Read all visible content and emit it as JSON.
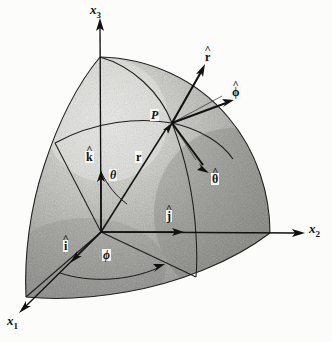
{
  "figure": {
    "background_color": "#fcfcfa",
    "ink_color": "#111111",
    "surface_fill_color": "#9a9a96",
    "surface_light_color": "#d8d8d4"
  },
  "axes": [
    {
      "id": "x3",
      "base": "x",
      "sub": "3",
      "label": "x3",
      "tip": [
        100,
        19
      ],
      "origin": [
        101,
        232
      ]
    },
    {
      "id": "x2",
      "base": "x",
      "sub": "2",
      "label": "x2",
      "tip": [
        305,
        233
      ],
      "origin": [
        101,
        232
      ]
    },
    {
      "id": "x1",
      "base": "x",
      "sub": "1",
      "label": "x1",
      "tip": [
        20,
        312
      ],
      "origin": [
        101,
        232
      ]
    }
  ],
  "point": {
    "label": "P",
    "position": [
      172,
      123
    ]
  },
  "vectors": [
    {
      "id": "r-hat",
      "label": "r",
      "hat": true,
      "bold": true,
      "tip": [
        205,
        66
      ],
      "from": [
        172,
        123
      ]
    },
    {
      "id": "phi-hat",
      "label": "ϕ",
      "hat": true,
      "bold": true,
      "tip": [
        231,
        100
      ],
      "from": [
        172,
        123
      ]
    },
    {
      "id": "theta-hat",
      "label": "θ",
      "hat": true,
      "bold": true,
      "tip": [
        209,
        172
      ],
      "from": [
        172,
        123
      ]
    },
    {
      "id": "k-hat",
      "label": "k",
      "hat": true,
      "bold": true,
      "tip": [
        101,
        173
      ],
      "from": [
        101,
        232
      ]
    },
    {
      "id": "j-hat",
      "label": "j",
      "hat": true,
      "bold": true,
      "tip": [
        182,
        232
      ],
      "from": [
        101,
        232
      ]
    },
    {
      "id": "i-hat",
      "label": "i",
      "hat": true,
      "bold": true,
      "tip": [
        72,
        262
      ],
      "from": [
        101,
        232
      ]
    },
    {
      "id": "r-vector",
      "label": "r",
      "hat": false,
      "bold": true,
      "tip": [
        172,
        123
      ],
      "from": [
        101,
        232
      ]
    }
  ],
  "angles": [
    {
      "id": "theta",
      "label": "θ",
      "position": [
        113,
        176
      ],
      "description": "polar angle from x3 axis to r"
    },
    {
      "id": "phi",
      "label": "ϕ",
      "position": [
        107,
        256
      ],
      "description": "azimuthal angle from x1 axis to projection of r"
    }
  ],
  "labels": {
    "x3": {
      "text": "x",
      "sub": "3",
      "x": 93,
      "y": 4
    },
    "x2": {
      "text": "x",
      "sub": "2",
      "x": 310,
      "y": 223
    },
    "x1": {
      "text": "x",
      "sub": "1",
      "x": 8,
      "y": 315
    },
    "P": {
      "text": "P",
      "x": 151,
      "y": 110
    },
    "r_hat": {
      "text": "r",
      "x": 206,
      "y": 52
    },
    "phi_hat": {
      "text": "ϕ",
      "x": 232,
      "y": 87
    },
    "theta_hat": {
      "text": "θ",
      "x": 212,
      "y": 174
    },
    "k_hat": {
      "text": "k",
      "x": 86,
      "y": 152
    },
    "j_hat": {
      "text": "j",
      "x": 167,
      "y": 211
    },
    "i_hat": {
      "text": "i",
      "x": 64,
      "y": 241
    },
    "r_vec": {
      "text": "r",
      "x": 136,
      "y": 152
    },
    "theta_ang": {
      "text": "θ",
      "x": 110,
      "y": 170
    },
    "phi_ang": {
      "text": "ϕ",
      "x": 103,
      "y": 250
    }
  }
}
